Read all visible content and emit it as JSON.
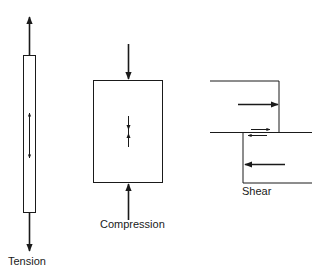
{
  "colors": {
    "stroke": "#1a1a1a",
    "background": "#ffffff"
  },
  "diagrams": {
    "tension": {
      "label": "Tension"
    },
    "compression": {
      "label": "Compression"
    },
    "shear": {
      "label": "Shear"
    }
  }
}
